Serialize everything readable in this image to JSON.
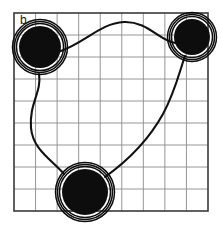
{
  "figure": {
    "panel_label": "b",
    "caption_label": "b",
    "background_color": "#ffffff",
    "grid": {
      "line_color": "#8a8a8a",
      "border_color": "#3a3a3a",
      "cols": 9,
      "rows": 9,
      "x": 14,
      "y": 13,
      "width": 194,
      "height": 198,
      "cell_width": 21.56,
      "cell_height": 22.0
    },
    "nodes": [
      {
        "id": "node-top-left",
        "label": "",
        "cx": 40,
        "cy": 47,
        "core_radius": 21,
        "ring_radii": [
          23.5,
          25.5,
          27.5
        ],
        "fill": "#0d0d0d",
        "ring_color": "#0d0d0d"
      },
      {
        "id": "node-top-right",
        "label": "",
        "cx": 192,
        "cy": 37,
        "core_radius": 18,
        "ring_radii": [
          20.5,
          22.5,
          24.5
        ],
        "fill": "#0d0d0d",
        "ring_color": "#0d0d0d"
      },
      {
        "id": "node-bottom",
        "label": "",
        "cx": 85,
        "cy": 192,
        "core_radius": 23,
        "ring_radii": [
          25.5,
          27.5,
          29.5
        ],
        "fill": "#0d0d0d",
        "ring_color": "#0d0d0d"
      }
    ],
    "edges": [
      {
        "id": "edge-top-left-to-top-right",
        "from": "node-top-left",
        "to": "node-top-right",
        "stroke": "#111111",
        "stroke_width": 2.1,
        "path": "M 58 52 C 84 44 100 23 124 22 C 148 21 160 42 176 43"
      },
      {
        "id": "edge-top-left-to-bottom",
        "from": "node-top-left",
        "to": "node-bottom",
        "stroke": "#111111",
        "stroke_width": 2.1,
        "path": "M 39 74 C 42 92 29 103 31 128 C 33 150 52 160 64 174"
      },
      {
        "id": "edge-bottom-to-top-right",
        "from": "node-bottom",
        "to": "node-top-right",
        "stroke": "#111111",
        "stroke_width": 2.1,
        "path": "M 105 177 C 126 162 148 141 163 114 C 175 92 180 70 185 56"
      }
    ]
  }
}
